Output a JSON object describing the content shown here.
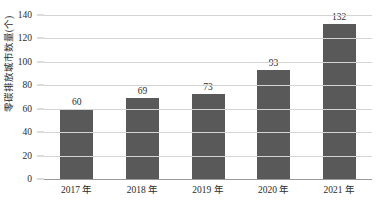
{
  "chart_data": {
    "type": "bar",
    "title": "",
    "subtitle": "",
    "xlabel": "",
    "ylabel": "零碳排放城市数量(个)",
    "categories": [
      "2017 年",
      "2018 年",
      "2019 年",
      "2020 年",
      "2021 年"
    ],
    "values": [
      60,
      69,
      73,
      93,
      132
    ],
    "data_labels": [
      "60",
      "69",
      "73",
      "93",
      "132"
    ],
    "series": [
      {
        "name": "零碳排放城市数量",
        "values": [
          60,
          69,
          73,
          93,
          132
        ]
      }
    ],
    "ylim": [
      0,
      140
    ],
    "y_ticks": [
      0,
      20,
      40,
      60,
      80,
      100,
      120,
      140
    ],
    "y_tick_labels": [
      "0",
      "20",
      "40",
      "60",
      "80",
      "100",
      "120",
      "140"
    ],
    "grid": true,
    "grid_axis": "y",
    "legend": false,
    "legend_position": "none",
    "bar_color": "#595959",
    "grid_color": "#d4d4d4",
    "axis_color": "#9a9a9a",
    "text_color": "#2b2b2b",
    "background_color": "#ffffff"
  }
}
